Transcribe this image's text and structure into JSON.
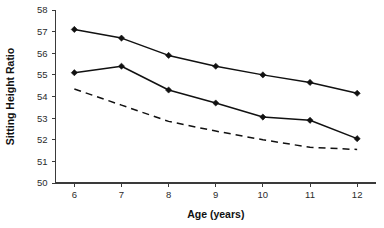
{
  "chart_data": {
    "type": "line",
    "title": "",
    "xlabel": "Age (years)",
    "ylabel": "Sitting Height Ratio",
    "x": [
      6,
      7,
      8,
      9,
      10,
      11,
      12
    ],
    "categories": [
      "6",
      "7",
      "8",
      "9",
      "10",
      "11",
      "12"
    ],
    "xlim": [
      5.6,
      12.4
    ],
    "ylim": [
      50,
      58
    ],
    "ytick_labels": [
      "50",
      "51",
      "52",
      "53",
      "54",
      "55",
      "56",
      "57",
      "58"
    ],
    "yticks": [
      50,
      51,
      52,
      53,
      54,
      55,
      56,
      57,
      58
    ],
    "grid": false,
    "legend": false,
    "legend_position": "none",
    "series": [
      {
        "name": "upper-solid-series",
        "style": "solid",
        "marker": "diamond",
        "color": "#111111",
        "values": [
          57.1,
          56.7,
          55.9,
          55.4,
          55.0,
          54.65,
          54.15
        ]
      },
      {
        "name": "lower-solid-series",
        "style": "solid",
        "marker": "diamond",
        "color": "#111111",
        "values": [
          55.1,
          55.4,
          54.3,
          53.7,
          53.05,
          52.9,
          52.05
        ]
      },
      {
        "name": "dashed-series",
        "style": "dashed",
        "marker": "none",
        "color": "#111111",
        "values": [
          54.35,
          53.6,
          52.85,
          52.4,
          52.0,
          51.65,
          51.55
        ]
      }
    ]
  },
  "axes": {
    "y_title": "Sitting Height Ratio",
    "x_title": "Age (years)"
  }
}
